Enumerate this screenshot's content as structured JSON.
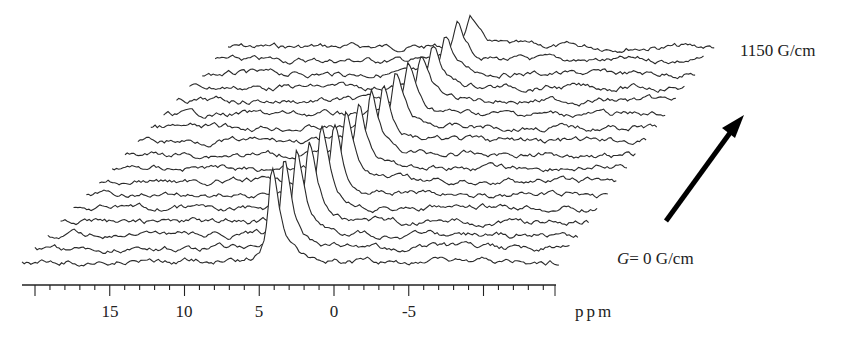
{
  "chart_data": {
    "type": "stacked-spectra",
    "title": "",
    "xlabel": "ppm",
    "ylabel": "",
    "x_ticks": [
      15,
      10,
      5,
      0,
      -5
    ],
    "x_range": [
      20,
      -3.5
    ],
    "x_axis_reversed": true,
    "n_traces": 17,
    "gradient_range": {
      "start": "G= 0 G/cm",
      "end": "1150 G/cm",
      "min": 0,
      "max": 1150,
      "unit": "G/cm"
    },
    "series": [
      {
        "name": "G=0",
        "peak_ppm": 6.0,
        "peak_height": 95
      },
      {
        "name": "trace-2",
        "peak_ppm": 6.0,
        "peak_height": 90
      },
      {
        "name": "trace-3",
        "peak_ppm": 6.0,
        "peak_height": 86
      },
      {
        "name": "trace-4",
        "peak_ppm": 6.0,
        "peak_height": 82
      },
      {
        "name": "trace-5",
        "peak_ppm": 6.0,
        "peak_height": 78
      },
      {
        "name": "trace-6",
        "peak_ppm": 6.0,
        "peak_height": 74
      },
      {
        "name": "trace-7",
        "peak_ppm": 6.0,
        "peak_height": 70
      },
      {
        "name": "trace-8",
        "peak_ppm": 6.0,
        "peak_height": 66
      },
      {
        "name": "trace-9",
        "peak_ppm": 6.0,
        "peak_height": 62
      },
      {
        "name": "trace-10",
        "peak_ppm": 6.0,
        "peak_height": 58
      },
      {
        "name": "trace-11",
        "peak_ppm": 6.0,
        "peak_height": 54
      },
      {
        "name": "trace-12",
        "peak_ppm": 6.0,
        "peak_height": 50
      },
      {
        "name": "trace-13",
        "peak_ppm": 6.0,
        "peak_height": 46
      },
      {
        "name": "trace-14",
        "peak_ppm": 6.0,
        "peak_height": 42
      },
      {
        "name": "trace-15",
        "peak_ppm": 6.0,
        "peak_height": 38
      },
      {
        "name": "trace-16",
        "peak_ppm": 6.0,
        "peak_height": 35
      },
      {
        "name": "G=1150",
        "peak_ppm": 6.0,
        "peak_height": 32
      }
    ],
    "annotations": [
      "1150 G/cm",
      "G= 0 G/cm",
      "arrow indicating increasing gradient"
    ],
    "grid": false,
    "legend": "none"
  },
  "labels": {
    "top": "1150 G/cm",
    "bottom_var": "G",
    "bottom_rest": "= 0 G/cm",
    "unit": "ppm"
  },
  "ticks": [
    {
      "label": "15",
      "x": 110
    },
    {
      "label": "10",
      "x": 184
    },
    {
      "label": "5",
      "x": 259
    },
    {
      "label": "0",
      "x": 334
    },
    {
      "label": "-5",
      "x": 409
    }
  ],
  "colors": {
    "line": "#2a2a2a",
    "arrow": "#000000"
  }
}
